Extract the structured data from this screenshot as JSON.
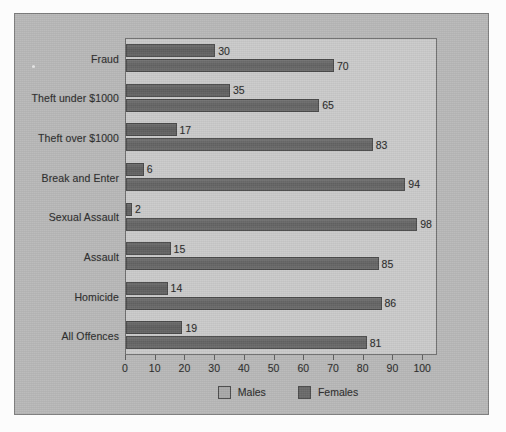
{
  "chart_data": {
    "type": "bar",
    "orientation": "horizontal",
    "title": "",
    "subtitle": "",
    "xlabel": "",
    "ylabel": "",
    "xlim": [
      0,
      105
    ],
    "xticks": [
      0,
      10,
      20,
      30,
      40,
      50,
      60,
      70,
      80,
      90,
      100
    ],
    "xtick_labels": [
      "0",
      "10",
      "20",
      "30",
      "40",
      "50",
      "60",
      "70",
      "80",
      "90",
      "100"
    ],
    "grid": false,
    "legend_position": "bottom",
    "categories": [
      "Fraud",
      "Theft under $1000",
      "Theft over $1000",
      "Break and Enter",
      "Sexual Assault",
      "Assault",
      "Homicide",
      "All Offences"
    ],
    "series": [
      {
        "name": "Females",
        "color": "#636363",
        "values": [
          30,
          35,
          17,
          6,
          2,
          15,
          14,
          19
        ],
        "value_labels": [
          "30",
          "35",
          "17",
          "6",
          "2",
          "15",
          "14",
          "19"
        ]
      },
      {
        "name": "Males",
        "color": "#6c6c6c",
        "values": [
          70,
          65,
          83,
          94,
          98,
          85,
          86,
          81
        ],
        "value_labels": [
          "70",
          "65",
          "83",
          "94",
          "98",
          "85",
          "86",
          "81"
        ]
      }
    ]
  },
  "legend": {
    "items": [
      {
        "label": "Males",
        "swatch": "legend-swatch-males"
      },
      {
        "label": "Females",
        "swatch": "legend-swatch-females"
      }
    ]
  },
  "colors": {
    "page_background": "#fcfcfc",
    "panel_background": "#b9b9b9",
    "plot_background": "#cbcbcb",
    "bar_females": "#636363",
    "bar_males": "#6c6c6c",
    "axis": "#5d5d5d",
    "text": "#2c2c2c"
  }
}
